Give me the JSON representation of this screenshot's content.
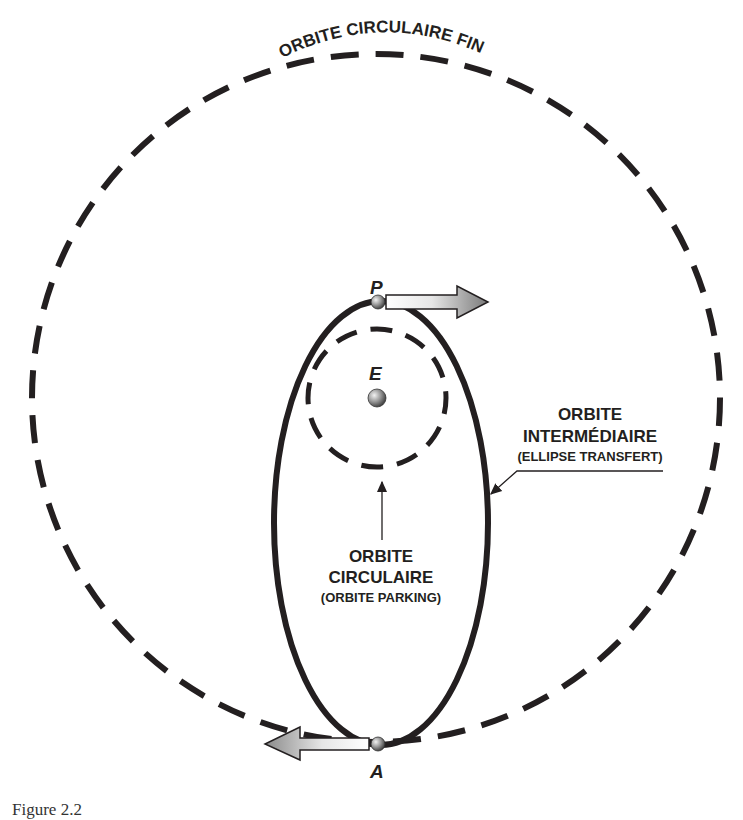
{
  "diagram": {
    "labels": {
      "final_orbit": "ORBITE CIRCULAIRE FINALE",
      "point_p": "P",
      "point_e": "E",
      "point_a": "A",
      "intermediate_line1": "ORBITE",
      "intermediate_line2": "INTERMÉDIAIRE",
      "intermediate_sub": "(ELLIPSE TRANSFERT)",
      "parking_line1": "ORBITE",
      "parking_line2": "CIRCULAIRE",
      "parking_sub": "(ORBITE PARKING)"
    },
    "colors": {
      "stroke": "#231f20",
      "arrow_fill": "#8a8a8a",
      "sphere": "#7d7d7d"
    }
  },
  "caption": "Figure 2.2"
}
